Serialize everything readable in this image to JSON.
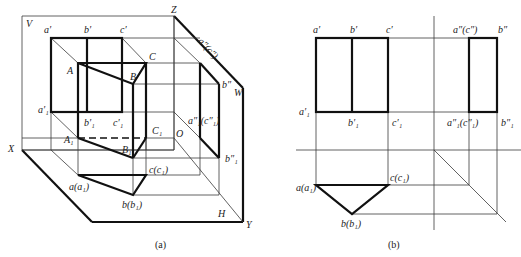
{
  "figure_a": {
    "caption": "(a)",
    "planes": {
      "v": "V",
      "h": "H",
      "w": "W"
    },
    "axes": {
      "x": "X",
      "y": "Y",
      "z": "Z",
      "origin": "O"
    },
    "labels": {
      "a_prime": "a′",
      "b_prime": "b′",
      "c_prime": "c′",
      "a1_prime": "a′₁",
      "b1_prime": "b′₁",
      "c1_prime": "c′₁",
      "A": "A",
      "B": "B",
      "C": "C",
      "A1": "A₁",
      "B1": "B₁",
      "C1": "C₁",
      "a_a1": "a(a₁)",
      "b_b1": "b(b₁)",
      "c_c1": "c(c₁)",
      "a2_c2": "a″(c″)",
      "b2": "b″",
      "a21_c21": "a″₁(c″₁)",
      "b21": "b″₁"
    }
  },
  "figure_b": {
    "caption": "(b)",
    "labels": {
      "a_prime": "a′",
      "b_prime": "b′",
      "c_prime": "c′",
      "a1_prime": "a′₁",
      "b1_prime": "b′₁",
      "c1_prime": "c′₁",
      "a2_c2": "a″(c″)",
      "b2": "b″",
      "a21_c21": "a″₁(c″₁)",
      "b21": "b″₁",
      "a_a1": "a(a₁)",
      "b_b1": "b(b₁)",
      "c_c1": "c(c₁)"
    }
  }
}
